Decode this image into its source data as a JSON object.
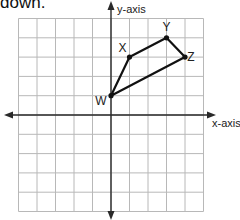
{
  "caption": "down.",
  "diagram": {
    "type": "coordinate-plane",
    "x_axis_label": "x-axis",
    "y_axis_label": "y-axis",
    "x_range": [
      -5,
      5
    ],
    "y_range": [
      -5,
      5
    ],
    "grid": true,
    "polygon": {
      "name": "WXYZ",
      "vertices": [
        {
          "label": "W",
          "x": 0,
          "y": 1
        },
        {
          "label": "X",
          "x": 1,
          "y": 3
        },
        {
          "label": "Y",
          "x": 3,
          "y": 4
        },
        {
          "label": "Z",
          "x": 4,
          "y": 3
        }
      ]
    }
  },
  "layout": {
    "origin_px": [
      111,
      115
    ],
    "cell_w": 18.5,
    "cell_h": 19.3,
    "label_offsets": {
      "W": [
        -10,
        9
      ],
      "X": [
        -7,
        -5
      ],
      "Y": [
        0,
        -7
      ],
      "Z": [
        6,
        4
      ]
    }
  }
}
